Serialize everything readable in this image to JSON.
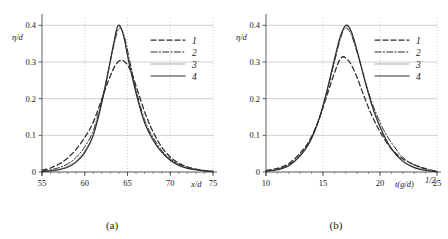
{
  "figure": {
    "panels": [
      {
        "id": "a",
        "caption": "(a)",
        "chart_ref": 0
      },
      {
        "id": "b",
        "caption": "(b)",
        "chart_ref": 1
      }
    ]
  },
  "chart_data": [
    {
      "type": "line",
      "panel": "(a)",
      "title": "",
      "xlabel": "x/d",
      "ylabel": "η/d",
      "xlim": [
        55,
        75
      ],
      "ylim": [
        0,
        0.42
      ],
      "xticks": [
        55,
        60,
        65,
        70,
        75
      ],
      "xtick_labels": [
        "55",
        "60",
        "65",
        "70",
        "75"
      ],
      "yticks": [
        0,
        0.1,
        0.2,
        0.3,
        0.4
      ],
      "ytick_labels": [
        "0",
        "0.1",
        "0.2",
        "0.3",
        "0.4"
      ],
      "grid": "dotted-vertical-solid-horizontal",
      "legend_position": "right-upper",
      "legend": [
        "1",
        "2",
        "3",
        "4"
      ],
      "legend_styles": [
        "dashed",
        "dash-dot",
        "thin-solid",
        "solid"
      ],
      "series": [
        {
          "name": "1",
          "style": "dashed",
          "peak_x": 64.3,
          "peak_y": 0.305,
          "x": [
            55,
            56,
            57,
            58,
            59,
            60,
            61,
            62,
            62.8,
            63.6,
            64.3,
            65,
            65.6,
            66.4,
            67.2,
            68,
            69,
            70,
            71,
            72,
            73,
            74,
            75
          ],
          "y": [
            0.005,
            0.011,
            0.022,
            0.038,
            0.062,
            0.094,
            0.136,
            0.199,
            0.251,
            0.292,
            0.305,
            0.292,
            0.262,
            0.206,
            0.152,
            0.109,
            0.068,
            0.041,
            0.024,
            0.014,
            0.008,
            0.004,
            0.002
          ]
        },
        {
          "name": "2",
          "style": "dash-dot",
          "peak_x": 64.0,
          "peak_y": 0.392,
          "x": [
            55,
            56,
            57,
            58,
            59,
            60,
            61,
            62,
            62.8,
            63.4,
            64.0,
            64.6,
            65.2,
            66,
            67,
            68,
            69,
            70,
            71,
            72,
            73,
            74,
            75
          ],
          "y": [
            0.003,
            0.006,
            0.012,
            0.022,
            0.04,
            0.069,
            0.113,
            0.197,
            0.279,
            0.345,
            0.392,
            0.372,
            0.31,
            0.225,
            0.142,
            0.094,
            0.059,
            0.036,
            0.021,
            0.012,
            0.007,
            0.004,
            0.002
          ]
        },
        {
          "name": "3",
          "style": "thin-solid",
          "peak_x": 63.9,
          "peak_y": 0.398,
          "x": [
            55,
            56,
            57,
            58,
            59,
            60,
            61,
            62,
            62.8,
            63.4,
            63.9,
            64.5,
            65.1,
            66,
            67,
            68,
            69,
            70,
            71,
            72,
            73,
            74,
            75
          ],
          "y": [
            0.002,
            0.004,
            0.008,
            0.016,
            0.031,
            0.058,
            0.104,
            0.191,
            0.28,
            0.35,
            0.398,
            0.374,
            0.306,
            0.216,
            0.136,
            0.089,
            0.055,
            0.033,
            0.019,
            0.011,
            0.006,
            0.003,
            0.001
          ]
        },
        {
          "name": "4",
          "style": "solid",
          "peak_x": 63.9,
          "peak_y": 0.4,
          "x": [
            55,
            56,
            57,
            58,
            59,
            60,
            61,
            62,
            62.8,
            63.4,
            63.9,
            64.5,
            65.1,
            66,
            67,
            68,
            69,
            70,
            71,
            72,
            73,
            74,
            75
          ],
          "y": [
            0.001,
            0.003,
            0.006,
            0.013,
            0.027,
            0.053,
            0.1,
            0.189,
            0.281,
            0.352,
            0.4,
            0.376,
            0.307,
            0.215,
            0.134,
            0.087,
            0.054,
            0.032,
            0.018,
            0.01,
            0.006,
            0.003,
            0.001
          ]
        }
      ]
    },
    {
      "type": "line",
      "panel": "(b)",
      "title": "",
      "xlabel": "t(g/d)^{1/2}",
      "xlabel_parts": {
        "base": "t(g/d)",
        "exponent": "1/2"
      },
      "ylabel": "η/d",
      "xlim": [
        10,
        25
      ],
      "ylim": [
        0,
        0.42
      ],
      "xticks": [
        10,
        15,
        20,
        25
      ],
      "xtick_labels": [
        "10",
        "15",
        "20",
        "25"
      ],
      "yticks": [
        0,
        0.1,
        0.2,
        0.3,
        0.4
      ],
      "ytick_labels": [
        "0",
        "0.1",
        "0.2",
        "0.3",
        "0.4"
      ],
      "grid": "dotted-vertical-solid-horizontal",
      "legend_position": "right-upper",
      "legend": [
        "1",
        "2",
        "3",
        "4"
      ],
      "legend_styles": [
        "dashed",
        "dash-dot",
        "thin-solid",
        "solid"
      ],
      "series": [
        {
          "name": "1",
          "style": "dashed",
          "peak_x": 16.6,
          "peak_y": 0.312,
          "x": [
            10,
            11,
            12,
            13,
            13.8,
            14.6,
            15.3,
            16.0,
            16.6,
            17.2,
            17.8,
            18.5,
            19.2,
            20,
            21,
            22,
            23,
            24,
            25
          ],
          "y": [
            0.004,
            0.01,
            0.023,
            0.052,
            0.085,
            0.14,
            0.204,
            0.27,
            0.312,
            0.305,
            0.272,
            0.215,
            0.16,
            0.11,
            0.063,
            0.036,
            0.02,
            0.009,
            0.002
          ]
        },
        {
          "name": "2",
          "style": "dash-dot",
          "peak_x": 16.9,
          "peak_y": 0.392,
          "x": [
            10,
            11,
            12,
            13,
            13.8,
            14.6,
            15.3,
            16.0,
            16.5,
            16.9,
            17.4,
            18.0,
            18.7,
            19.4,
            20.2,
            21,
            22,
            23,
            24,
            25
          ],
          "y": [
            0.003,
            0.008,
            0.02,
            0.048,
            0.082,
            0.14,
            0.212,
            0.3,
            0.36,
            0.392,
            0.38,
            0.325,
            0.248,
            0.18,
            0.122,
            0.08,
            0.04,
            0.019,
            0.008,
            0.002
          ]
        },
        {
          "name": "3",
          "style": "thin-solid",
          "peak_x": 17.0,
          "peak_y": 0.397,
          "x": [
            10,
            11,
            12,
            13,
            13.8,
            14.6,
            15.3,
            16.0,
            16.5,
            17.0,
            17.5,
            18.1,
            18.8,
            19.5,
            20.3,
            21,
            22,
            23,
            24,
            25
          ],
          "y": [
            0.002,
            0.007,
            0.018,
            0.045,
            0.08,
            0.14,
            0.215,
            0.305,
            0.365,
            0.397,
            0.38,
            0.318,
            0.236,
            0.165,
            0.105,
            0.066,
            0.031,
            0.013,
            0.005,
            0.001
          ]
        },
        {
          "name": "4",
          "style": "solid",
          "peak_x": 17.0,
          "peak_y": 0.4,
          "x": [
            10,
            11,
            12,
            13,
            13.8,
            14.6,
            15.3,
            16.0,
            16.5,
            17.0,
            17.5,
            18.1,
            18.8,
            19.5,
            20.3,
            21,
            22,
            23,
            24,
            25
          ],
          "y": [
            0.002,
            0.006,
            0.017,
            0.044,
            0.079,
            0.139,
            0.216,
            0.307,
            0.368,
            0.4,
            0.382,
            0.318,
            0.234,
            0.162,
            0.102,
            0.063,
            0.029,
            0.012,
            0.004,
            0.001
          ]
        }
      ]
    }
  ],
  "style": {
    "axis_color": "#4d4d4d",
    "grid_color": "#b0b0b0",
    "curve_color": "#2b2b2b",
    "thin_curve_color": "#6e6e6e",
    "background": "#ffffff"
  }
}
